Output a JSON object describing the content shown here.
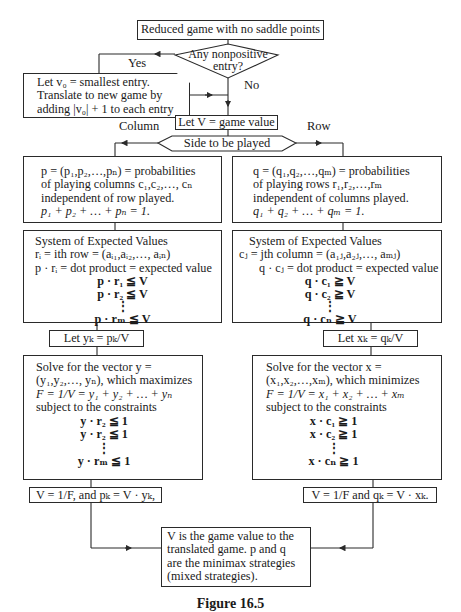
{
  "start": {
    "label": "Reduced game with no saddle points"
  },
  "decision_nonpositive": {
    "line1": "Any nonpositive",
    "line2": "entry?",
    "yes_label": "Yes",
    "no_label": "No"
  },
  "translate_box": {
    "lines": [
      "Let v₀ = smallest entry.",
      "Translate to new game by",
      "adding |v₀| + 1 to each entry"
    ]
  },
  "let_v": {
    "label": "Let V = game value"
  },
  "side_decision": {
    "label": "Side to be played",
    "left_label": "Column",
    "right_label": "Row"
  },
  "column_branch": {
    "prob_box": [
      "p = (p₁,p₂,…,pₙ) = probabilities",
      "of playing columns c₁,c₂,…, cₙ",
      "independent of row played.",
      "p₁ + p₂ + … + pₙ = 1."
    ],
    "expected_box": {
      "title": "System of Expected Values",
      "lines": [
        "rᵢ = ith row = (aᵢ₁,aᵢ₂,…, aᵢₙ)",
        "p · rᵢ = dot product = expected value"
      ],
      "ineqs": [
        "p · r₁ ≦ V",
        "p · r₂ ≦ V",
        "⋮",
        "p · rₘ ≦ V"
      ]
    },
    "let_box": "Let yₖ = pₖ/V",
    "solve_box": {
      "lines": [
        "Solve for the vector y =",
        "(y₁,y₂,…, yₙ), which maximizes",
        "F = 1/V = y₁ + y₂ + … + yₙ",
        "subject to the constraints"
      ],
      "ineqs": [
        "y · r₂ ≦ 1",
        "y · r₂ ≦ 1",
        "⋮",
        "y · rₘ ≦ 1"
      ]
    },
    "result_box": "V = 1/F, and pₖ = V · yₖ,"
  },
  "row_branch": {
    "prob_box": [
      "q = (q₁,q₂,…,qₘ) = probabilities",
      "of playing rows r₁,r₂,…,rₘ",
      "independent of columns played.",
      "q₁ + q₂ + … + qₘ = 1."
    ],
    "expected_box": {
      "title": "System of Expected Values",
      "lines": [
        "cⱼ = jth column = (a₁ⱼ,a₂ⱼ,…, aₘⱼ)",
        "q · cⱼ = dot product = expected value"
      ],
      "ineqs": [
        "q · c₁ ≧ V",
        "q · c₂ ≧ V",
        "⋮",
        "q · cₙ ≧ V"
      ]
    },
    "let_box": "Let xₖ = qₖ/V",
    "solve_box": {
      "lines": [
        "Solve for the vector x =",
        "(x₁,x₂,…,xₘ), which minimizes",
        "F = 1/V = x₁ + x₂ + … + xₘ",
        "subject to the constraints"
      ],
      "ineqs": [
        "x · c₁ ≧ 1",
        "x · c₂ ≧ 1",
        "⋮",
        "x · cₙ ≧ 1"
      ]
    },
    "result_box": "V = 1/F and qₖ = V · xₖ."
  },
  "final_box": {
    "lines": [
      "V is the game value to the",
      "translated game. p and q",
      "are the minimax strategies",
      "(mixed strategies)."
    ]
  },
  "caption": "Figure 16.5"
}
